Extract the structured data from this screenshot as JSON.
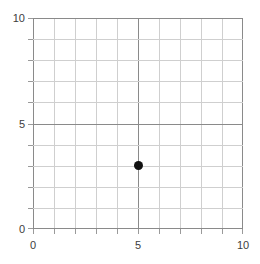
{
  "chart_data": {
    "type": "scatter",
    "title": "",
    "subtitle": "",
    "xlabel": "",
    "ylabel": "",
    "xlim": [
      0,
      10
    ],
    "ylim": [
      0,
      10
    ],
    "grid": true,
    "grid_major_step": 5,
    "grid_minor_step": 1,
    "legend": null,
    "annotations": [],
    "x_ticks": [
      {
        "value": 0,
        "label": "0",
        "major": true
      },
      {
        "value": 1,
        "label": "",
        "major": false
      },
      {
        "value": 2,
        "label": "",
        "major": false
      },
      {
        "value": 3,
        "label": "",
        "major": false
      },
      {
        "value": 4,
        "label": "",
        "major": false
      },
      {
        "value": 5,
        "label": "5",
        "major": true
      },
      {
        "value": 6,
        "label": "",
        "major": false
      },
      {
        "value": 7,
        "label": "",
        "major": false
      },
      {
        "value": 8,
        "label": "",
        "major": false
      },
      {
        "value": 9,
        "label": "",
        "major": false
      },
      {
        "value": 10,
        "label": "10",
        "major": true
      }
    ],
    "y_ticks": [
      {
        "value": 0,
        "label": "0",
        "major": true
      },
      {
        "value": 1,
        "label": "",
        "major": false
      },
      {
        "value": 2,
        "label": "",
        "major": false
      },
      {
        "value": 3,
        "label": "",
        "major": false
      },
      {
        "value": 4,
        "label": "",
        "major": false
      },
      {
        "value": 5,
        "label": "5",
        "major": true
      },
      {
        "value": 6,
        "label": "",
        "major": false
      },
      {
        "value": 7,
        "label": "",
        "major": false
      },
      {
        "value": 8,
        "label": "",
        "major": false
      },
      {
        "value": 9,
        "label": "",
        "major": false
      },
      {
        "value": 10,
        "label": "10",
        "major": true
      }
    ],
    "series": [
      {
        "name": "point",
        "marker": "circle",
        "color": "#111111",
        "points": [
          {
            "x": 5,
            "y": 3
          }
        ]
      }
    ]
  },
  "colors": {
    "background": "#ffffff",
    "grid_major": "#8a8a8a",
    "grid_minor": "#cfcfcf",
    "tick": "#9a9a9a",
    "label_text": "#3d3d3d",
    "marker": "#111111"
  }
}
